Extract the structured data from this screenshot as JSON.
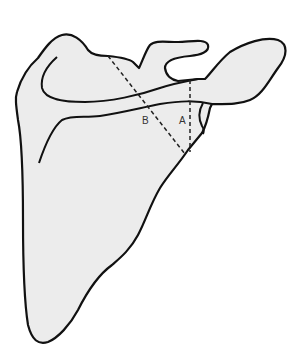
{
  "diagram": {
    "colors": {
      "background": "#ffffff",
      "bone_fill": "#ececec",
      "outline": "#111111",
      "dashed": "#222222",
      "label": "#333333"
    },
    "labels": {
      "a": "A",
      "b": "B"
    },
    "lines": [
      {
        "id": "A",
        "style": "dashed",
        "orientation": "vertical"
      },
      {
        "id": "B",
        "style": "dashed",
        "orientation": "oblique"
      }
    ]
  }
}
